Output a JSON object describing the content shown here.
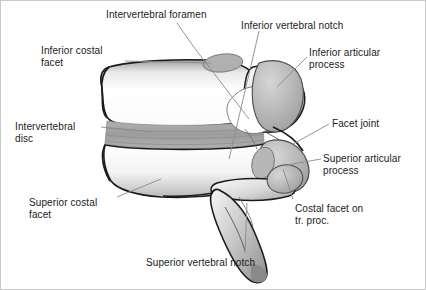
{
  "figure": {
    "background_color": "#ffffff",
    "border_color": "#c9c9c9",
    "text_color": "#1a1a1a",
    "leader_line_color": "#8a8a8a",
    "bone_outline_color": "#1b1b1b",
    "bone_fill_light": "#fdfdfd",
    "bone_fill_mid": "#bdbdbd",
    "bone_fill_dark": "#9a9a9a",
    "disc_color": "#a8a8a8"
  },
  "labels": [
    {
      "id": "intervertebral-foramen",
      "text": "Intervertebral foramen",
      "x": 105,
      "y": 8,
      "align": "left"
    },
    {
      "id": "inferior-vertebral-notch",
      "text": "Inferior vertebral notch",
      "x": 240,
      "y": 19,
      "align": "left"
    },
    {
      "id": "inferior-costal-facet",
      "text": "Inferior costal\nfacet",
      "x": 40,
      "y": 44,
      "align": "left"
    },
    {
      "id": "inferior-articular-process",
      "text": "Inferior articular\nprocess",
      "x": 308,
      "y": 46,
      "align": "left"
    },
    {
      "id": "intervertebral-disc",
      "text": "Intervertebral\ndisc",
      "x": 14,
      "y": 120,
      "align": "left"
    },
    {
      "id": "facet-joint",
      "text": "Facet joint",
      "x": 331,
      "y": 117,
      "align": "left"
    },
    {
      "id": "superior-articular-process",
      "text": "Superior articular\nprocess",
      "x": 322,
      "y": 152,
      "align": "left"
    },
    {
      "id": "superior-costal-facet",
      "text": "Superior costal\nfacet",
      "x": 28,
      "y": 196,
      "align": "left"
    },
    {
      "id": "costal-facet-on-tr-proc",
      "text": "Costal facet on\ntr. proc.",
      "x": 294,
      "y": 202,
      "align": "left"
    },
    {
      "id": "superior-vertebral-notch",
      "text": "Superior vertebral notch",
      "x": 145,
      "y": 256,
      "align": "left"
    }
  ]
}
